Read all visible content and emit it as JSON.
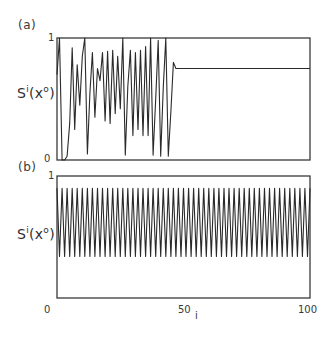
{
  "chart_data": [
    {
      "type": "line",
      "panel": "(a)",
      "ylabel": "S^i(x^0)",
      "xlabel": "",
      "ylim": [
        0,
        1
      ],
      "xlim": [
        0,
        100
      ],
      "ytick_labels": [
        "0",
        "1"
      ],
      "grid": false,
      "legend": null,
      "x": [
        0,
        1,
        2,
        3,
        4,
        5,
        6,
        7,
        8,
        9,
        10,
        11,
        12,
        13,
        14,
        15,
        16,
        17,
        18,
        19,
        20,
        21,
        22,
        23,
        24,
        25,
        26,
        27,
        28,
        29,
        30,
        31,
        32,
        33,
        34,
        35,
        36,
        37,
        38,
        39,
        40,
        41,
        42,
        43,
        44,
        45,
        46,
        47,
        48,
        49,
        50,
        51,
        52,
        53,
        54,
        55,
        56,
        57,
        58,
        59,
        60,
        61,
        62,
        63,
        64,
        65,
        66,
        67,
        68,
        69,
        70,
        71,
        72,
        73,
        74,
        75,
        76,
        77,
        78,
        79,
        80,
        81,
        82,
        83,
        84,
        85,
        86,
        87,
        88,
        89,
        90,
        91,
        92,
        93,
        94,
        95,
        96,
        97,
        98,
        99,
        100
      ],
      "values": [
        0.7,
        1.0,
        0.0,
        0.0,
        0.03,
        0.3,
        0.92,
        0.25,
        0.78,
        0.45,
        0.85,
        1.0,
        0.05,
        0.55,
        0.88,
        0.35,
        0.75,
        0.65,
        0.88,
        0.32,
        0.89,
        0.3,
        0.9,
        0.38,
        0.85,
        0.42,
        1.0,
        0.04,
        0.6,
        0.9,
        0.2,
        0.88,
        0.25,
        0.9,
        0.2,
        0.93,
        0.2,
        1.0,
        0.04,
        0.5,
        0.98,
        0.03,
        0.6,
        1.0,
        0.03,
        0.4,
        0.8,
        0.75,
        0.75,
        0.75,
        0.75,
        0.75,
        0.75,
        0.75,
        0.75,
        0.75,
        0.75,
        0.75,
        0.75,
        0.75,
        0.75,
        0.75,
        0.75,
        0.75,
        0.75,
        0.75,
        0.75,
        0.75,
        0.75,
        0.75,
        0.75,
        0.75,
        0.75,
        0.75,
        0.75,
        0.75,
        0.75,
        0.75,
        0.75,
        0.75,
        0.75,
        0.75,
        0.75,
        0.75,
        0.75,
        0.75,
        0.75,
        0.75,
        0.75,
        0.75,
        0.75,
        0.75,
        0.75,
        0.75,
        0.75,
        0.75,
        0.75,
        0.75,
        0.75,
        0.75,
        0.75
      ]
    },
    {
      "type": "line",
      "panel": "(b)",
      "ylabel": "S^i(x^0)",
      "xlabel": "i",
      "ylim": [
        0,
        1
      ],
      "xlim": [
        0,
        100
      ],
      "ytick_labels": [
        "0",
        "1"
      ],
      "xtick_labels": [
        "0",
        "50",
        "100"
      ],
      "grid": false,
      "legend": null,
      "description": "period-2 oscillation for all i from 0 to 100",
      "high": 0.9,
      "low": 0.34,
      "period": 2
    }
  ],
  "labels": {
    "panel_a": "(a)",
    "panel_b": "(b)",
    "ylabel_main": "S",
    "ylabel_sup_i": "i",
    "ylabel_paren_open": "(x",
    "ylabel_sup_0": "o",
    "ylabel_paren_close": ")",
    "ytick_one": "1",
    "ytick_zero": "0",
    "xtick_0": "0",
    "xtick_50": "50",
    "xtick_100": "100",
    "xlabel": "i"
  }
}
